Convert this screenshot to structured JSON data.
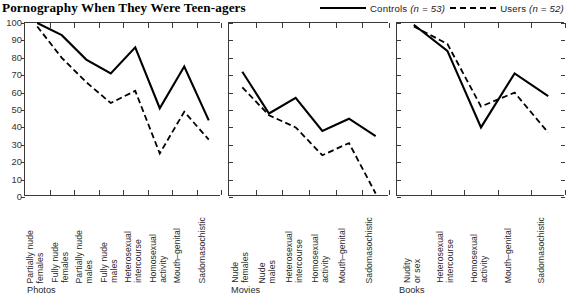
{
  "title": "Pornography When They Were Teen-agers",
  "legend": {
    "position": "top-right",
    "entries": [
      {
        "label": "Controls",
        "n_text": "(n = 53)",
        "style": "solid",
        "color": "#000000"
      },
      {
        "label": "Users",
        "n_text": "(n = 52)",
        "style": "dashed",
        "color": "#000000"
      }
    ]
  },
  "chart_data": {
    "type": "line",
    "title": "Pornography When They Were Teen-agers",
    "xlabel": "",
    "ylabel": "",
    "ylim": [
      0,
      100
    ],
    "yticks": [
      0,
      10,
      20,
      30,
      40,
      50,
      60,
      70,
      80,
      90,
      100
    ],
    "ytick_labels": [
      "0",
      "10",
      "20",
      "30",
      "40",
      "50",
      "60",
      "70",
      "80",
      "90",
      "100"
    ],
    "grid": false,
    "legend_position": "top-right",
    "panels": [
      {
        "name": "Photos",
        "categories": [
          "Partially nude\nfemales",
          "Fully nude\nfemales",
          "Partially nude\nmales",
          "Fully nude\nmales",
          "Heterosexual\nintercourse",
          "Homosexual\nactivity",
          "Mouth–genital",
          "Sadomasochistic"
        ],
        "series": [
          {
            "name": "Controls",
            "style": "solid",
            "values": [
              100,
              93,
              79,
              71,
              86,
              51,
              75,
              44
            ]
          },
          {
            "name": "Users",
            "style": "dashed",
            "values": [
              98,
              80,
              66,
              54,
              61,
              25,
              49,
              33
            ]
          }
        ]
      },
      {
        "name": "Movies",
        "categories": [
          "Nude\nfemales",
          "Nude\nmales",
          "Heterosexual\nintercourse",
          "Homosexual\nactivity",
          "Mouth–genital",
          "Sadomasochistic"
        ],
        "series": [
          {
            "name": "Controls",
            "style": "solid",
            "values": [
              72,
              48,
              57,
              38,
              45,
              35
            ]
          },
          {
            "name": "Users",
            "style": "dashed",
            "values": [
              63,
              47,
              40,
              24,
              31,
              2
            ]
          }
        ]
      },
      {
        "name": "Books",
        "categories": [
          "Nudity\nor sex",
          "Heterosexual\nintercourse",
          "Homosexual\nactivity",
          "Mouth–genital",
          "Sadomasochistic"
        ],
        "series": [
          {
            "name": "Controls",
            "style": "solid",
            "values": [
              99,
              84,
              40,
              71,
              58
            ]
          },
          {
            "name": "Users",
            "style": "dashed",
            "values": [
              98,
              88,
              52,
              60,
              37
            ]
          }
        ]
      }
    ]
  }
}
